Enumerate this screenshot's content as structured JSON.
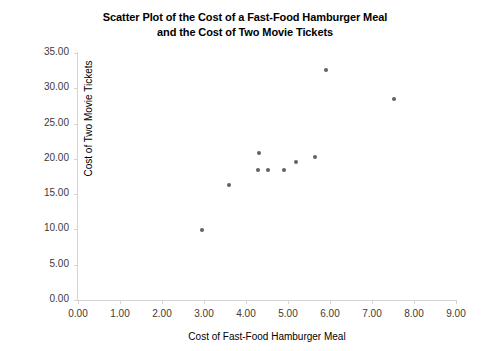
{
  "chart_data": {
    "type": "scatter",
    "title": "Scatter Plot of the Cost of a Fast-Food Hamburger Meal and the Cost of Two Movie Tickets",
    "title_lines": [
      "Scatter Plot of the Cost of a Fast-Food Hamburger Meal",
      "and the Cost of Two Movie Tickets"
    ],
    "xlabel": "Cost of Fast-Food Hamburger Meal",
    "ylabel": "Cost of Two Movie Tickets",
    "xlim": [
      0,
      9
    ],
    "ylim": [
      0,
      35
    ],
    "xticks": [
      0,
      1,
      2,
      3,
      4,
      5,
      6,
      7,
      8,
      9
    ],
    "yticks": [
      0,
      5,
      10,
      15,
      20,
      25,
      30,
      35
    ],
    "xtick_labels": [
      "0.00",
      "1.00",
      "2.00",
      "3.00",
      "4.00",
      "5.00",
      "6.00",
      "7.00",
      "8.00",
      "9.00"
    ],
    "ytick_labels": [
      "0.00",
      "5.00",
      "10.00",
      "15.00",
      "20.00",
      "25.00",
      "30.00",
      "35.00"
    ],
    "grid": false,
    "legend": false,
    "marker_color": "#60606a",
    "axis_color": "#d4d4d4",
    "points": [
      {
        "x": 2.95,
        "y": 9.85
      },
      {
        "x": 3.6,
        "y": 16.3
      },
      {
        "x": 4.31,
        "y": 20.85
      },
      {
        "x": 4.29,
        "y": 18.4
      },
      {
        "x": 4.52,
        "y": 18.4
      },
      {
        "x": 4.9,
        "y": 18.4
      },
      {
        "x": 5.19,
        "y": 19.55
      },
      {
        "x": 5.64,
        "y": 20.25
      },
      {
        "x": 5.9,
        "y": 32.6
      },
      {
        "x": 7.52,
        "y": 28.45
      }
    ]
  }
}
